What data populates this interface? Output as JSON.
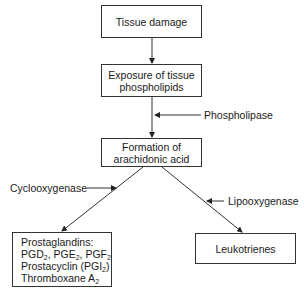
{
  "diagram": {
    "nodes": {
      "tissue_damage": {
        "label": "Tissue damage"
      },
      "exposure": {
        "line1": "Exposure of tissue",
        "line2": "phospholipids"
      },
      "arachidonic": {
        "line1": "Formation of",
        "line2": "arachidonic acid"
      },
      "prostaglandins": {
        "line1": "Prostaglandins:",
        "line2": {
          "a": "PGD",
          "a_sub": "2",
          "b": ", PGE",
          "b_sub": "2",
          "c": ", PGF",
          "c_sub": "2"
        },
        "line3": {
          "a": "Prostacyclin (PGI",
          "a_sub": "2",
          "b": ")"
        },
        "line4": {
          "a": "Thromboxane A",
          "a_sub": "2"
        }
      },
      "leukotrienes": {
        "label": "Leukotrienes"
      }
    },
    "enzymes": {
      "phospholipase": "Phospholipase",
      "cyclooxygenase": "Cyclooxygenase",
      "lipooxygenase": "Lipooxygenase"
    },
    "edges": [
      {
        "from": "Tissue damage",
        "to": "Exposure of tissue phospholipids"
      },
      {
        "from": "Exposure of tissue phospholipids",
        "to": "Formation of arachidonic acid",
        "enzyme": "Phospholipase"
      },
      {
        "from": "Formation of arachidonic acid",
        "to": "Prostaglandins",
        "enzyme": "Cyclooxygenase"
      },
      {
        "from": "Formation of arachidonic acid",
        "to": "Leukotrienes",
        "enzyme": "Lipooxygenase"
      }
    ],
    "colors": {
      "line": "#333333",
      "text": "#1a1a1a",
      "background": "#ffffff"
    }
  }
}
